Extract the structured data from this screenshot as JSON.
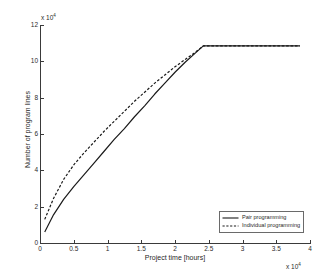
{
  "chart_data": {
    "type": "line",
    "title": "",
    "xlabel": "Project time [hours]",
    "ylabel": "Number of program lines",
    "x_multiplier": "x 10",
    "x_multiplier_exponent": "4",
    "y_multiplier": "x 10",
    "y_multiplier_exponent": "4",
    "xlim": [
      0,
      4
    ],
    "ylim": [
      0,
      12
    ],
    "xticks": [
      "0",
      "0.5",
      "1",
      "1.5",
      "2",
      "2.5",
      "3",
      "3.5",
      "4"
    ],
    "xtick_values": [
      0,
      0.5,
      1,
      1.5,
      2,
      2.5,
      3,
      3.5,
      4
    ],
    "yticks": [
      "0",
      "2",
      "4",
      "6",
      "8",
      "10",
      "12"
    ],
    "ytick_values": [
      0,
      2,
      4,
      6,
      8,
      10,
      12
    ],
    "grid": false,
    "legend_position": "lower right",
    "series": [
      {
        "name": "Pair programming",
        "style": "solid",
        "color": "#1a1a1a",
        "x": [
          0.07,
          0.2,
          0.35,
          0.5,
          0.65,
          0.8,
          0.95,
          1.1,
          1.25,
          1.4,
          1.55,
          1.7,
          1.85,
          2.0,
          2.15,
          2.3,
          2.42,
          2.55,
          2.8,
          3.1,
          3.4,
          3.85
        ],
        "y": [
          0.6,
          1.55,
          2.4,
          3.1,
          3.75,
          4.4,
          5.05,
          5.7,
          6.3,
          6.95,
          7.55,
          8.2,
          8.8,
          9.4,
          9.95,
          10.45,
          10.85,
          10.85,
          10.85,
          10.85,
          10.85,
          10.85
        ]
      },
      {
        "name": "Individual programming",
        "style": "dashed",
        "color": "#1a1a1a",
        "x": [
          0.07,
          0.2,
          0.35,
          0.5,
          0.65,
          0.8,
          0.95,
          1.1,
          1.25,
          1.4,
          1.55,
          1.7,
          1.85,
          2.0,
          2.15,
          2.3,
          2.42,
          2.55,
          2.8,
          3.1,
          3.4,
          3.85
        ],
        "y": [
          1.3,
          2.45,
          3.5,
          4.3,
          4.95,
          5.55,
          6.15,
          6.7,
          7.25,
          7.8,
          8.3,
          8.8,
          9.25,
          9.7,
          10.1,
          10.5,
          10.85,
          10.85,
          10.85,
          10.85,
          10.85,
          10.85
        ]
      }
    ],
    "legend": [
      {
        "label": "Pair programming",
        "style": "solid"
      },
      {
        "label": "Individual programming",
        "style": "dashed"
      }
    ]
  }
}
